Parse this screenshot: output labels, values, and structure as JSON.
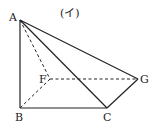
{
  "title": "(イ)",
  "points": {
    "A": {
      "label": "A",
      "x": 20,
      "y": 20
    },
    "B": {
      "label": "B",
      "x": 20,
      "y": 108
    },
    "C": {
      "label": "C",
      "x": 107,
      "y": 108
    },
    "F": {
      "label": "F",
      "x": 50,
      "y": 79
    },
    "G": {
      "label": "G",
      "x": 138,
      "y": 79
    }
  },
  "solid_edges": [
    [
      "A",
      "B"
    ],
    [
      "B",
      "C"
    ],
    [
      "A",
      "C"
    ],
    [
      "A",
      "G"
    ],
    [
      "C",
      "G"
    ]
  ],
  "dashed_edges": [
    [
      "A",
      "F"
    ],
    [
      "F",
      "B"
    ],
    [
      "F",
      "G"
    ]
  ],
  "colors": {
    "stroke": "#222222",
    "background": "#ffffff"
  }
}
